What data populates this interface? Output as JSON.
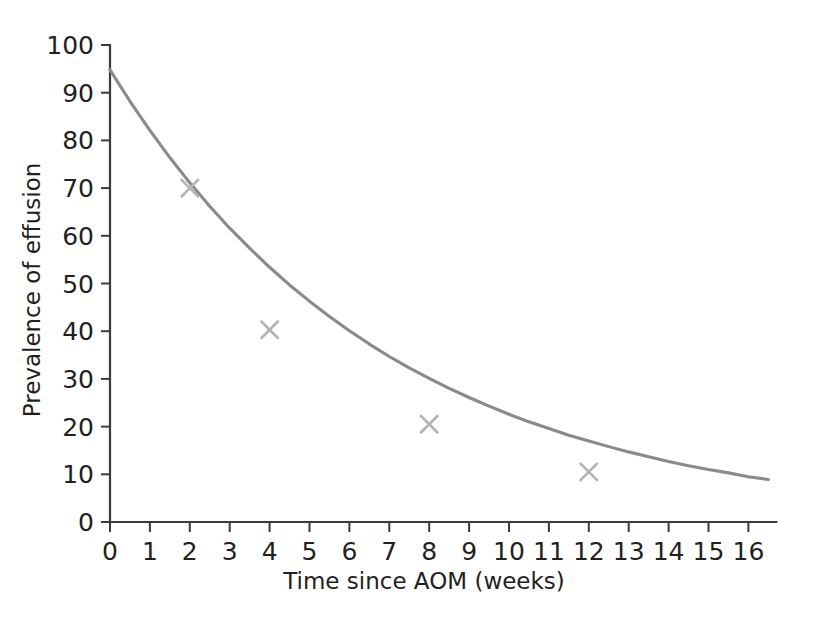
{
  "chart_data": {
    "type": "line",
    "title": "",
    "subtitle": "",
    "xlabel": "Time since AOM (weeks)",
    "ylabel": "Prevalence of effusion",
    "xlim": [
      0,
      16.7
    ],
    "ylim": [
      0,
      100
    ],
    "grid": false,
    "legend": null,
    "x_ticks": [
      0,
      1,
      2,
      3,
      4,
      5,
      6,
      7,
      8,
      9,
      10,
      11,
      12,
      13,
      14,
      15,
      16
    ],
    "x_tick_labels": [
      "0",
      "1",
      "2",
      "3",
      "4",
      "5",
      "6",
      "7",
      "8",
      "9",
      "10",
      "11",
      "12",
      "13",
      "14",
      "15",
      "16"
    ],
    "y_ticks": [
      0,
      10,
      20,
      30,
      40,
      50,
      60,
      70,
      80,
      90,
      100
    ],
    "y_tick_labels": [
      "0",
      "10",
      "20",
      "30",
      "40",
      "50",
      "60",
      "70",
      "80",
      "90",
      "100"
    ],
    "series": [
      {
        "name": "fitted decay curve",
        "type": "line",
        "color": "#8a8a8a",
        "marker": "none",
        "x": [
          0,
          0.5,
          1,
          1.5,
          2,
          2.5,
          3,
          3.5,
          4,
          4.5,
          5,
          5.5,
          6,
          6.5,
          7,
          7.5,
          8,
          8.5,
          9,
          9.5,
          10,
          10.5,
          11,
          11.5,
          12,
          12.5,
          13,
          13.5,
          14,
          14.5,
          15,
          15.5,
          16,
          16.5
        ],
        "y": [
          94.8,
          88.2,
          82.1,
          76.4,
          71.1,
          66.2,
          61.6,
          57.4,
          53.4,
          49.7,
          46.3,
          43.1,
          40.1,
          37.3,
          34.7,
          32.3,
          30.1,
          28.0,
          26.1,
          24.3,
          22.6,
          21.0,
          19.6,
          18.2,
          17.0,
          15.8,
          14.7,
          13.7,
          12.7,
          11.8,
          11.0,
          10.3,
          9.5,
          8.9
        ]
      },
      {
        "name": "observed data points",
        "type": "scatter",
        "color": "#b3b3b3",
        "marker": "x",
        "x": [
          2,
          4,
          8,
          12
        ],
        "y": [
          70.0,
          40.3,
          20.5,
          10.5
        ]
      }
    ]
  }
}
